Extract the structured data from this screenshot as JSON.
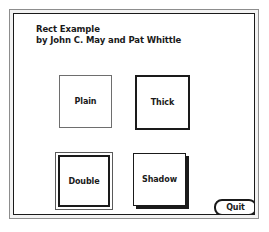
{
  "window": {
    "title_line_1": "Rect Example",
    "title_line_2": "by John C. May and Pat Whittle",
    "frame_color": "#1a1a1a",
    "background": "#ffffff"
  },
  "shapes": [
    {
      "name": "plain",
      "label": "Plain",
      "border_style": "plain",
      "border_width_px": 1,
      "border_color": "#6e6e6e"
    },
    {
      "name": "thick",
      "label": "Thick",
      "border_style": "thick",
      "border_width_px": 3,
      "border_color": "#1a1a1a"
    },
    {
      "name": "double",
      "label": "Double",
      "border_style": "double",
      "border_width_px": 2,
      "border_color": "#1a1a1a"
    },
    {
      "name": "shadow",
      "label": "Shadow",
      "border_style": "shadow",
      "border_width_px": 2,
      "border_color": "#1a1a1a",
      "shadow_offset_px": 3
    }
  ],
  "buttons": {
    "quit_label": "Quit"
  }
}
